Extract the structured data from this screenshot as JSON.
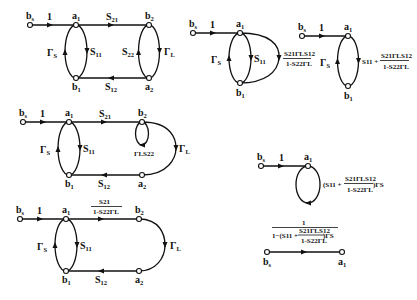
{
  "diagrams": [
    {
      "id": "full-signal-flow",
      "nodes": {
        "bs": "b",
        "bs_sub": "s",
        "a1": "a",
        "a1_sub": "1",
        "b1": "b",
        "b1_sub": "1",
        "b2": "b",
        "b2_sub": "2",
        "a2": "a",
        "a2_sub": "2"
      },
      "edges": {
        "bs_a1": "1",
        "S21": "S",
        "S21_sub": "21",
        "S11": "S",
        "S11_sub": "11",
        "GammaS": "Γ",
        "GammaS_sub": "S",
        "S22": "S",
        "S22_sub": "22",
        "GammaL": "Γ",
        "GammaL_sub": "L",
        "S12": "S",
        "S12_sub": "12"
      }
    },
    {
      "id": "reduced-combined-loop",
      "nodes": {
        "bs": "b",
        "bs_sub": "s",
        "a1": "a",
        "a1_sub": "1",
        "b1": "b",
        "b1_sub": "1"
      },
      "edges": {
        "bs_a1": "1",
        "S11": "S",
        "S11_sub": "11",
        "GammaS": "Γ",
        "GammaS_sub": "S",
        "parallel_num": "S21ΓLS12",
        "parallel_den": "1-S22ΓL"
      }
    },
    {
      "id": "merged-parallel",
      "nodes": {
        "bs": "b",
        "bs_sub": "s",
        "a1": "a",
        "a1_sub": "1",
        "b1": "b",
        "b1_sub": "1"
      },
      "edges": {
        "bs_a1": "1",
        "GammaS": "Γ",
        "GammaS_sub": "S",
        "sum_prefix": "S11 +",
        "sum_num": "S21ΓLS12",
        "sum_den": "1-S22ΓL"
      }
    },
    {
      "id": "self-loop-b2",
      "nodes": {
        "bs": "b",
        "bs_sub": "s",
        "a1": "a",
        "a1_sub": "1",
        "b1": "b",
        "b1_sub": "1",
        "b2": "b",
        "b2_sub": "2",
        "a2": "a",
        "a2_sub": "2"
      },
      "edges": {
        "bs_a1": "1",
        "S21": "S",
        "S21_sub": "21",
        "S11": "S",
        "S11_sub": "11",
        "GammaS": "Γ",
        "GammaS_sub": "S",
        "loop": "ΓLS22",
        "GammaL": "Γ",
        "GammaL_sub": "L",
        "S12": "S",
        "S12_sub": "12"
      }
    },
    {
      "id": "self-loop-removed",
      "nodes": {
        "bs": "b",
        "bs_sub": "s",
        "a1": "a",
        "a1_sub": "1",
        "b1": "b",
        "b1_sub": "1",
        "b2": "b",
        "b2_sub": "2",
        "a2": "a",
        "a2_sub": "2"
      },
      "edges": {
        "bs_a1": "1",
        "S21_num": "S21",
        "S21_den": "1-S22ΓL",
        "S11": "S",
        "S11_sub": "11",
        "GammaS": "Γ",
        "GammaS_sub": "S",
        "GammaL": "Γ",
        "GammaL_sub": "L",
        "S12": "S",
        "S12_sub": "12"
      }
    },
    {
      "id": "single-self-loop-a1",
      "nodes": {
        "bs": "b",
        "bs_sub": "s",
        "a1": "a",
        "a1_sub": "1"
      },
      "edges": {
        "bs_a1": "1",
        "loop_prefix": "(S11 +",
        "loop_num": "S21ΓLS12",
        "loop_den": "1-S22ΓL",
        "loop_suffix": ")ΓS"
      }
    },
    {
      "id": "final-transfer",
      "nodes": {
        "bs": "b",
        "bs_sub": "s",
        "a1": "a",
        "a1_sub": "1"
      },
      "edges": {
        "num": "1",
        "den_prefix": "1−(S11 +",
        "den_inner_num": "S21ΓLS12",
        "den_inner_den": "1-S22ΓL",
        "den_suffix": ")ΓS"
      }
    }
  ]
}
